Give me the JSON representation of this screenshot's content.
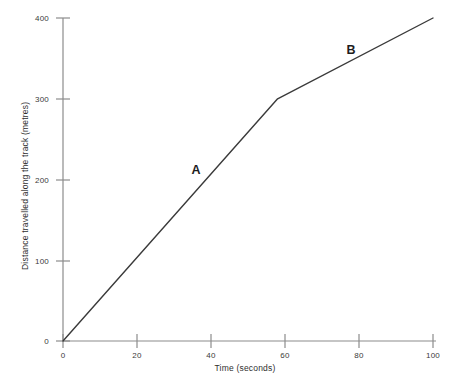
{
  "chart_data": {
    "type": "line",
    "title": "",
    "xlabel": "Time (seconds)",
    "ylabel": "Distance travelled along the track (metres)",
    "xlim": [
      0,
      100
    ],
    "ylim": [
      0,
      400
    ],
    "xticks": [
      0,
      20,
      40,
      60,
      80,
      100
    ],
    "yticks": [
      0,
      100,
      200,
      300,
      400
    ],
    "xtick_labels": [
      "0",
      "20",
      "40",
      "60",
      "80",
      "100"
    ],
    "ytick_labels": [
      "0",
      "100",
      "200",
      "300",
      "400"
    ],
    "grid": false,
    "legend": "none",
    "line_color": "#3a3a3a",
    "axis_color": "#8c8c8c",
    "series": [
      {
        "name": "journey",
        "x": [
          0,
          58,
          100
        ],
        "y": [
          0,
          300,
          400
        ]
      }
    ],
    "annotations": [
      {
        "text": "A",
        "x": 36,
        "y": 205
      },
      {
        "text": "B",
        "x": 78,
        "y": 348
      }
    ]
  }
}
